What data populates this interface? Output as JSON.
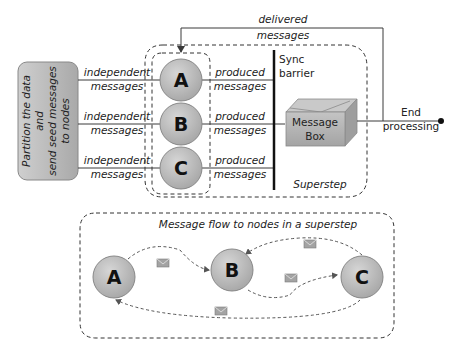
{
  "diagram": {
    "partition_box": {
      "lines": [
        "Partition the data",
        "and",
        "send seed messages",
        "to nodes"
      ]
    },
    "input_edges": [
      {
        "line1": "independent",
        "line2": "messages"
      },
      {
        "line1": "independent",
        "line2": "messages"
      },
      {
        "line1": "independent",
        "line2": "messages"
      }
    ],
    "nodes": [
      {
        "label": "A"
      },
      {
        "label": "B"
      },
      {
        "label": "C"
      }
    ],
    "output_edges": [
      {
        "line1": "produced",
        "line2": "messages"
      },
      {
        "line1": "produced",
        "line2": "messages"
      },
      {
        "line1": "produced",
        "line2": "messages"
      }
    ],
    "sync_barrier": {
      "line1": "Sync",
      "line2": "barrier"
    },
    "message_box": {
      "line1": "Message",
      "line2": "Box"
    },
    "feedback": {
      "line1": "delivered",
      "line2": "messages"
    },
    "end": {
      "line1": "End",
      "line2": "processing"
    },
    "superstep_label": "Superstep",
    "flow_panel": {
      "title": "Message flow to nodes in a superstep",
      "nodes": [
        {
          "label": "A"
        },
        {
          "label": "B"
        },
        {
          "label": "C"
        }
      ],
      "edges": [
        {
          "from": "A",
          "to": "B"
        },
        {
          "from": "C",
          "to": "B"
        },
        {
          "from": "B",
          "to": "C"
        },
        {
          "from": "C",
          "to": "A"
        }
      ]
    },
    "colors": {
      "node_fill": "#b9b9b9",
      "box_fill": "#b3b3b3",
      "line": "#3a3a3a",
      "envelope": "#9a9a9a"
    }
  }
}
